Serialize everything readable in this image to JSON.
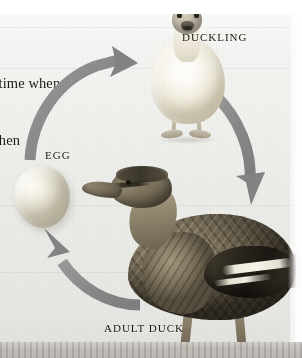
{
  "page": {
    "figure_title": "Duck life cycle diagram",
    "body_text_line_1": "e a time when",
    "body_text_line_2": "e when"
  },
  "diagram": {
    "type": "life-cycle",
    "cycle_direction": "clockwise",
    "stages": [
      {
        "id": "egg",
        "label": "EGG",
        "subject": "duck-egg"
      },
      {
        "id": "duckling",
        "label": "DUCKLING",
        "subject": "duckling-chick"
      },
      {
        "id": "adult",
        "label": "ADULT DUCK",
        "subject": "mallard-hen"
      }
    ],
    "arrows": [
      {
        "id": "egg-to-duckling",
        "from": "EGG",
        "to": "DUCKLING",
        "direction": "up-right"
      },
      {
        "id": "duckling-to-adult",
        "from": "DUCKLING",
        "to": "ADULT DUCK",
        "direction": "down-right"
      },
      {
        "id": "adult-to-egg",
        "from": "ADULT DUCK",
        "to": "EGG",
        "direction": "left-up"
      }
    ]
  },
  "colors": {
    "arrow": "#8a8a8a",
    "arrow_shadow": "#a9a9a9",
    "label_text": "#16140f",
    "body_text": "#1d1b18",
    "paper": "#ebebe8",
    "page_edge": "#b4b1ab"
  }
}
